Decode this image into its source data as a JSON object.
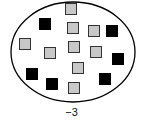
{
  "diagram": {
    "ellipse": {
      "cx": 73,
      "cy": 52,
      "rx": 62,
      "ry": 50,
      "stroke": "#000000"
    },
    "gray_color": "#c8c8c8",
    "black_color": "#000000",
    "squares": [
      {
        "type": "gray",
        "x": 65,
        "y": 3
      },
      {
        "type": "gray",
        "x": 67,
        "y": 22
      },
      {
        "type": "gray",
        "x": 88,
        "y": 25
      },
      {
        "type": "gray",
        "x": 19,
        "y": 38
      },
      {
        "type": "gray",
        "x": 44,
        "y": 47
      },
      {
        "type": "gray",
        "x": 68,
        "y": 41
      },
      {
        "type": "gray",
        "x": 90,
        "y": 46
      },
      {
        "type": "gray",
        "x": 72,
        "y": 62
      },
      {
        "type": "gray",
        "x": 68,
        "y": 82
      },
      {
        "type": "black",
        "x": 39,
        "y": 18
      },
      {
        "type": "black",
        "x": 106,
        "y": 25
      },
      {
        "type": "black",
        "x": 112,
        "y": 53
      },
      {
        "type": "black",
        "x": 26,
        "y": 68
      },
      {
        "type": "black",
        "x": 46,
        "y": 78
      },
      {
        "type": "black",
        "x": 99,
        "y": 73
      }
    ],
    "counts": {
      "gray": 9,
      "black": 6
    },
    "label": "−3"
  }
}
